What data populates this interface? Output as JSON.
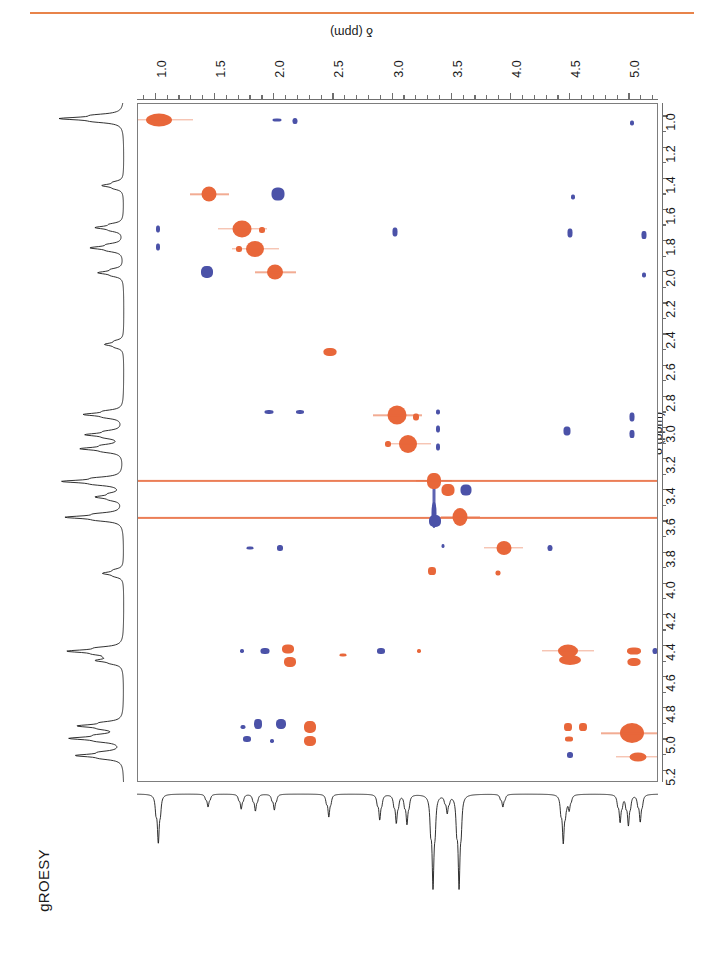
{
  "figure": {
    "label": "gROESY",
    "experiment": "gROESY",
    "top_axis_title": "δ (ppm)",
    "right_axis_title": "δ (ppm)",
    "rule_color": "#E8834A"
  },
  "colors": {
    "positive_contour": "#E8673A",
    "negative_contour": "#4B52A8",
    "frame": "#7d7d7d",
    "trace": "#1a1a1a"
  },
  "chart_data": {
    "type": "heatmap",
    "title": "gROESY",
    "xlabel": "δ (ppm)",
    "ylabel": "δ (ppm)",
    "xlim": [
      0.85,
      5.25
    ],
    "ylim": [
      0.92,
      5.28
    ],
    "x_axis_position": "top",
    "y_axis_position": "right",
    "x_reversed": false,
    "y_reversed": false,
    "grid": false,
    "legend": "none",
    "xticks": [
      1.0,
      1.5,
      2.0,
      2.5,
      3.0,
      3.5,
      4.0,
      4.5,
      5.0
    ],
    "xticklabels": [
      "1.0",
      "1.5",
      "2.0",
      "2.5",
      "3.0",
      "3.5",
      "4.0",
      "4.5",
      "5.0"
    ],
    "x_minor_step": 0.1,
    "yticks": [
      1.0,
      1.2,
      1.4,
      1.6,
      1.8,
      2.0,
      2.2,
      2.4,
      2.6,
      2.8,
      3.0,
      3.2,
      3.4,
      3.6,
      3.8,
      4.0,
      4.2,
      4.4,
      4.6,
      4.8,
      5.0,
      5.2
    ],
    "yticklabels": [
      "1.0",
      "1.2",
      "1.4",
      "1.6",
      "1.8",
      "2.0",
      "2.2",
      "2.4",
      "2.6",
      "2.8",
      "3.0",
      "3.2",
      "3.4",
      "3.6",
      "3.8",
      "4.0",
      "4.2",
      "4.4",
      "4.6",
      "4.8",
      "5.0",
      "5.2"
    ],
    "y_minor_step": 0.1,
    "peaks": [
      {
        "x": 1.03,
        "y": 1.02,
        "w": 26,
        "h": 13,
        "sign": "pos",
        "kind": "diagonal"
      },
      {
        "x": 2.02,
        "y": 1.02,
        "w": 9,
        "h": 3,
        "sign": "neg",
        "kind": "cross"
      },
      {
        "x": 2.18,
        "y": 1.03,
        "w": 5,
        "h": 6,
        "sign": "neg",
        "kind": "cross"
      },
      {
        "x": 5.02,
        "y": 1.04,
        "w": 4,
        "h": 5,
        "sign": "neg",
        "kind": "cross"
      },
      {
        "x": 1.45,
        "y": 1.5,
        "w": 15,
        "h": 15,
        "sign": "pos",
        "kind": "diagonal"
      },
      {
        "x": 2.03,
        "y": 1.5,
        "w": 13,
        "h": 13,
        "sign": "neg",
        "kind": "cross"
      },
      {
        "x": 4.52,
        "y": 1.52,
        "w": 4,
        "h": 5,
        "sign": "neg",
        "kind": "cross"
      },
      {
        "x": 1.02,
        "y": 1.72,
        "w": 4,
        "h": 7,
        "sign": "neg",
        "kind": "cross"
      },
      {
        "x": 1.73,
        "y": 1.72,
        "w": 19,
        "h": 17,
        "sign": "pos",
        "kind": "diagonal"
      },
      {
        "x": 1.9,
        "y": 1.73,
        "w": 6,
        "h": 6,
        "sign": "pos",
        "kind": "cross"
      },
      {
        "x": 3.02,
        "y": 1.74,
        "w": 5,
        "h": 9,
        "sign": "neg",
        "kind": "cross"
      },
      {
        "x": 4.5,
        "y": 1.75,
        "w": 5,
        "h": 9,
        "sign": "neg",
        "kind": "cross"
      },
      {
        "x": 5.12,
        "y": 1.76,
        "w": 5,
        "h": 8,
        "sign": "neg",
        "kind": "cross"
      },
      {
        "x": 1.02,
        "y": 1.84,
        "w": 4,
        "h": 7,
        "sign": "neg",
        "kind": "cross"
      },
      {
        "x": 1.7,
        "y": 1.85,
        "w": 6,
        "h": 6,
        "sign": "pos",
        "kind": "cross"
      },
      {
        "x": 1.84,
        "y": 1.85,
        "w": 18,
        "h": 16,
        "sign": "pos",
        "kind": "diagonal"
      },
      {
        "x": 1.43,
        "y": 2.0,
        "w": 12,
        "h": 12,
        "sign": "neg",
        "kind": "cross"
      },
      {
        "x": 2.01,
        "y": 2.0,
        "w": 16,
        "h": 15,
        "sign": "pos",
        "kind": "diagonal"
      },
      {
        "x": 5.12,
        "y": 2.02,
        "w": 4,
        "h": 5,
        "sign": "neg",
        "kind": "cross"
      },
      {
        "x": 2.47,
        "y": 2.51,
        "w": 13,
        "h": 8,
        "sign": "pos",
        "kind": "diagonal"
      },
      {
        "x": 1.96,
        "y": 2.9,
        "w": 9,
        "h": 4,
        "sign": "neg",
        "kind": "cross"
      },
      {
        "x": 2.22,
        "y": 2.9,
        "w": 8,
        "h": 4,
        "sign": "neg",
        "kind": "cross"
      },
      {
        "x": 3.04,
        "y": 2.92,
        "w": 19,
        "h": 19,
        "sign": "pos",
        "kind": "diagonal"
      },
      {
        "x": 3.2,
        "y": 2.93,
        "w": 6,
        "h": 7,
        "sign": "pos",
        "kind": "cross"
      },
      {
        "x": 3.38,
        "y": 2.9,
        "w": 4,
        "h": 5,
        "sign": "neg",
        "kind": "cross"
      },
      {
        "x": 5.02,
        "y": 2.93,
        "w": 5,
        "h": 9,
        "sign": "neg",
        "kind": "cross"
      },
      {
        "x": 3.38,
        "y": 3.01,
        "w": 4,
        "h": 7,
        "sign": "neg",
        "kind": "cross"
      },
      {
        "x": 4.47,
        "y": 3.02,
        "w": 7,
        "h": 9,
        "sign": "neg",
        "kind": "cross"
      },
      {
        "x": 5.02,
        "y": 3.04,
        "w": 5,
        "h": 8,
        "sign": "neg",
        "kind": "cross"
      },
      {
        "x": 2.96,
        "y": 3.1,
        "w": 6,
        "h": 6,
        "sign": "pos",
        "kind": "cross"
      },
      {
        "x": 3.13,
        "y": 3.1,
        "w": 18,
        "h": 18,
        "sign": "pos",
        "kind": "diagonal"
      },
      {
        "x": 3.38,
        "y": 3.12,
        "w": 4,
        "h": 7,
        "sign": "neg",
        "kind": "cross"
      },
      {
        "x": 3.35,
        "y": 3.34,
        "w": 14,
        "h": 16,
        "sign": "pos",
        "kind": "diagonal-solvent"
      },
      {
        "x": 3.47,
        "y": 3.4,
        "w": 13,
        "h": 12,
        "sign": "pos",
        "kind": "cross"
      },
      {
        "x": 3.62,
        "y": 3.4,
        "w": 11,
        "h": 11,
        "sign": "neg",
        "kind": "cross"
      },
      {
        "x": 3.35,
        "y": 3.56,
        "w": 5,
        "h": 26,
        "sign": "neg",
        "kind": "streak-v"
      },
      {
        "x": 3.57,
        "y": 3.57,
        "w": 15,
        "h": 18,
        "sign": "pos",
        "kind": "diagonal-solvent"
      },
      {
        "x": 3.36,
        "y": 3.6,
        "w": 12,
        "h": 12,
        "sign": "neg",
        "kind": "cross"
      },
      {
        "x": 1.8,
        "y": 3.77,
        "w": 7,
        "h": 3,
        "sign": "neg",
        "kind": "cross"
      },
      {
        "x": 2.05,
        "y": 3.77,
        "w": 6,
        "h": 6,
        "sign": "neg",
        "kind": "cross"
      },
      {
        "x": 3.43,
        "y": 3.76,
        "w": 3,
        "h": 4,
        "sign": "neg",
        "kind": "cross"
      },
      {
        "x": 3.94,
        "y": 3.77,
        "w": 15,
        "h": 14,
        "sign": "pos",
        "kind": "diagonal"
      },
      {
        "x": 4.33,
        "y": 3.77,
        "w": 5,
        "h": 6,
        "sign": "neg",
        "kind": "cross"
      },
      {
        "x": 3.33,
        "y": 3.92,
        "w": 8,
        "h": 8,
        "sign": "pos",
        "kind": "cross"
      },
      {
        "x": 3.89,
        "y": 3.93,
        "w": 5,
        "h": 5,
        "sign": "pos",
        "kind": "cross"
      },
      {
        "x": 1.73,
        "y": 4.43,
        "w": 4,
        "h": 4,
        "sign": "neg",
        "kind": "cross"
      },
      {
        "x": 1.92,
        "y": 4.43,
        "w": 9,
        "h": 6,
        "sign": "neg",
        "kind": "cross"
      },
      {
        "x": 2.12,
        "y": 4.42,
        "w": 12,
        "h": 9,
        "sign": "pos",
        "kind": "cross"
      },
      {
        "x": 2.13,
        "y": 4.5,
        "w": 12,
        "h": 10,
        "sign": "pos",
        "kind": "cross"
      },
      {
        "x": 2.58,
        "y": 4.46,
        "w": 7,
        "h": 3,
        "sign": "pos",
        "kind": "cross"
      },
      {
        "x": 2.9,
        "y": 4.43,
        "w": 8,
        "h": 6,
        "sign": "neg",
        "kind": "cross"
      },
      {
        "x": 3.22,
        "y": 4.43,
        "w": 4,
        "h": 4,
        "sign": "pos",
        "kind": "cross"
      },
      {
        "x": 4.48,
        "y": 4.43,
        "w": 20,
        "h": 13,
        "sign": "pos",
        "kind": "diagonal"
      },
      {
        "x": 4.5,
        "y": 4.49,
        "w": 22,
        "h": 10,
        "sign": "pos",
        "kind": "cross"
      },
      {
        "x": 5.04,
        "y": 4.43,
        "w": 14,
        "h": 7,
        "sign": "pos",
        "kind": "cross"
      },
      {
        "x": 5.04,
        "y": 4.5,
        "w": 13,
        "h": 8,
        "sign": "pos",
        "kind": "cross"
      },
      {
        "x": 5.22,
        "y": 4.43,
        "w": 5,
        "h": 6,
        "sign": "neg",
        "kind": "cross"
      },
      {
        "x": 1.74,
        "y": 4.92,
        "w": 5,
        "h": 4,
        "sign": "neg",
        "kind": "cross"
      },
      {
        "x": 1.86,
        "y": 4.9,
        "w": 8,
        "h": 10,
        "sign": "neg",
        "kind": "cross"
      },
      {
        "x": 2.06,
        "y": 4.9,
        "w": 10,
        "h": 10,
        "sign": "neg",
        "kind": "cross"
      },
      {
        "x": 2.3,
        "y": 4.92,
        "w": 12,
        "h": 12,
        "sign": "pos",
        "kind": "cross"
      },
      {
        "x": 1.77,
        "y": 5.0,
        "w": 8,
        "h": 6,
        "sign": "neg",
        "kind": "cross"
      },
      {
        "x": 1.98,
        "y": 5.01,
        "w": 4,
        "h": 4,
        "sign": "neg",
        "kind": "cross"
      },
      {
        "x": 2.3,
        "y": 5.01,
        "w": 12,
        "h": 10,
        "sign": "pos",
        "kind": "cross"
      },
      {
        "x": 4.48,
        "y": 4.92,
        "w": 8,
        "h": 8,
        "sign": "pos",
        "kind": "cross"
      },
      {
        "x": 4.61,
        "y": 4.92,
        "w": 8,
        "h": 8,
        "sign": "pos",
        "kind": "cross"
      },
      {
        "x": 4.49,
        "y": 5.0,
        "w": 8,
        "h": 5,
        "sign": "pos",
        "kind": "cross"
      },
      {
        "x": 4.5,
        "y": 5.1,
        "w": 6,
        "h": 6,
        "sign": "neg",
        "kind": "cross"
      },
      {
        "x": 5.02,
        "y": 4.96,
        "w": 24,
        "h": 20,
        "sign": "pos",
        "kind": "diagonal"
      },
      {
        "x": 5.07,
        "y": 5.11,
        "w": 17,
        "h": 9,
        "sign": "pos",
        "kind": "diagonal"
      }
    ],
    "solvent_streaks": [
      {
        "axis": "horizontal",
        "y": 3.34,
        "sign": "pos",
        "note": "solvent t1-noise ridge"
      },
      {
        "axis": "horizontal",
        "y": 3.58,
        "sign": "pos",
        "note": "solvent t1-noise ridge"
      },
      {
        "axis": "vertical",
        "x": 3.35,
        "sign": "neg",
        "y_from": 3.34,
        "y_to": 3.62,
        "note": "solvent artifact column"
      }
    ],
    "projection_f2_peaks_ppm": [
      1.03,
      1.45,
      1.73,
      1.85,
      2.01,
      2.47,
      2.9,
      3.04,
      3.13,
      3.35,
      3.47,
      3.57,
      3.94,
      4.45,
      4.5,
      4.93,
      5.0,
      5.1
    ],
    "projection_f1_peaks_ppm": [
      1.02,
      1.45,
      1.72,
      1.85,
      2.01,
      2.47,
      2.92,
      3.05,
      3.14,
      3.35,
      3.45,
      3.58,
      3.94,
      4.44,
      4.5,
      4.92,
      5.0,
      5.11
    ]
  }
}
